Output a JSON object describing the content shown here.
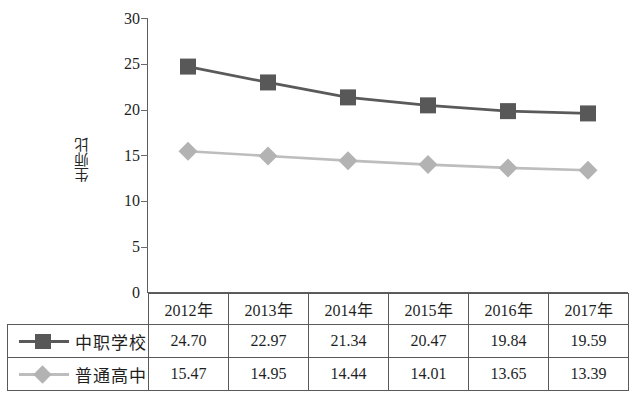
{
  "chart_data": {
    "type": "line",
    "title": "",
    "xlabel": "",
    "ylabel": "生师比",
    "ylim": [
      0,
      30
    ],
    "ytick_step": 5,
    "yticks": [
      "30",
      "25",
      "20",
      "15",
      "10",
      "5",
      "0"
    ],
    "grid": false,
    "legend_position": "table-row-labels",
    "categories": [
      "2012年",
      "2013年",
      "2014年",
      "2015年",
      "2016年",
      "2017年"
    ],
    "series": [
      {
        "name": "中职学校",
        "marker": "square",
        "color": "#585858",
        "line_color": "#5a5a5a",
        "values": [
          24.7,
          22.97,
          21.34,
          20.47,
          19.84,
          19.59
        ],
        "labels": [
          "24.70",
          "22.97",
          "21.34",
          "20.47",
          "19.84",
          "19.59"
        ]
      },
      {
        "name": "普通高中",
        "marker": "diamond",
        "color": "#b3b3b3",
        "line_color": "#bdbdbd",
        "values": [
          15.47,
          14.95,
          14.44,
          14.01,
          13.65,
          13.39
        ],
        "labels": [
          "15.47",
          "14.95",
          "14.44",
          "14.01",
          "13.65",
          "13.39"
        ]
      }
    ]
  },
  "table": {
    "corner_cell": "",
    "header": [
      "2012年",
      "2013年",
      "2014年",
      "2015年",
      "2016年",
      "2017年"
    ],
    "rows": [
      {
        "label": "中职学校",
        "marker": "square",
        "values": [
          "24.70",
          "22.97",
          "21.34",
          "20.47",
          "19.84",
          "19.59"
        ]
      },
      {
        "label": "普通高中",
        "marker": "diamond",
        "values": [
          "15.47",
          "14.95",
          "14.44",
          "14.01",
          "13.65",
          "13.39"
        ]
      }
    ]
  },
  "colors": {
    "series_1": "#585858",
    "series_2": "#b3b3b3",
    "axis": "#5d5d5d",
    "table_border": "#595959",
    "text": "#1f1f1f",
    "background": "#ffffff"
  }
}
